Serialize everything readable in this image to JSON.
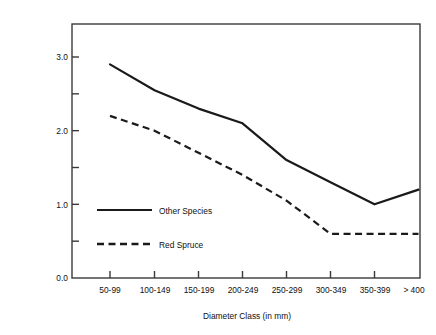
{
  "figure": {
    "top_caption": "Density of Live Trees by Diameter Class",
    "background_color": "#ffffff",
    "line_color": "#1a1a1a",
    "axis_color": "#3a3a3a"
  },
  "axes": {
    "y_title_line1": "Density of Live Trees (# of stems/ha)",
    "y_title_line2": "(log)",
    "x_title": "Diameter Class (in mm)",
    "y_major_labels": [
      "3.0",
      "2.0",
      "1.0",
      "0.0"
    ],
    "y_major_values": [
      3.0,
      2.0,
      1.0,
      0.0
    ],
    "y_minor_values": [
      2.5,
      1.5,
      0.5
    ],
    "y_min": 0.0,
    "y_max": 3.4
  },
  "legend": {
    "items": [
      {
        "label": "Other Species",
        "style": "solid"
      },
      {
        "label": "Red Spruce",
        "style": "dashed"
      }
    ]
  },
  "chart_data": {
    "type": "line",
    "title": "Density of Live Trees by Diameter Class",
    "xlabel": "Diameter Class (in mm)",
    "ylabel": "Density of Live Trees (# of stems/ha) (log)",
    "categories": [
      "50-99",
      "100-149",
      "150-199",
      "200-249",
      "250-299",
      "300-349",
      "350-399",
      "> 400"
    ],
    "ylim": [
      0.0,
      3.4
    ],
    "yticks": [
      0.0,
      0.5,
      1.0,
      1.5,
      2.0,
      2.5,
      3.0
    ],
    "ytick_labels": [
      "0.0",
      "",
      "1.0",
      "",
      "2.0",
      "",
      "3.0"
    ],
    "grid": false,
    "legend_position": "inside-lower-left",
    "series": [
      {
        "name": "Other Species",
        "style": "solid",
        "color": "#1a1a1a",
        "values": [
          2.9,
          2.55,
          2.3,
          2.1,
          1.6,
          1.3,
          1.0,
          1.2
        ]
      },
      {
        "name": "Red Spruce",
        "style": "dashed",
        "color": "#1a1a1a",
        "values": [
          2.2,
          2.0,
          1.7,
          1.4,
          1.05,
          0.6,
          0.6,
          0.6
        ]
      }
    ]
  }
}
